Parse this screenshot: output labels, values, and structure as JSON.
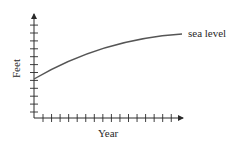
{
  "chart_data": {
    "type": "line",
    "title": "",
    "xlabel": "Year",
    "ylabel": "Feet",
    "x_ticks_count": 16,
    "y_ticks_count": 12,
    "tick_labels_shown": false,
    "grid": false,
    "legend": null,
    "series": [
      {
        "name": "sea level",
        "shape": "increasing, concave down (rising at a decreasing rate)",
        "x": [
          0,
          2,
          4,
          6,
          8,
          10,
          12,
          14,
          16
        ],
        "values": [
          4.9,
          6.2,
          7.3,
          8.3,
          9.1,
          9.8,
          10.3,
          10.7,
          10.9
        ]
      }
    ],
    "annotations": [
      {
        "text": "sea level",
        "position": "end of curve, right side"
      }
    ],
    "colors": {
      "axis": "#2a2a2a",
      "curve": "#555555"
    }
  }
}
